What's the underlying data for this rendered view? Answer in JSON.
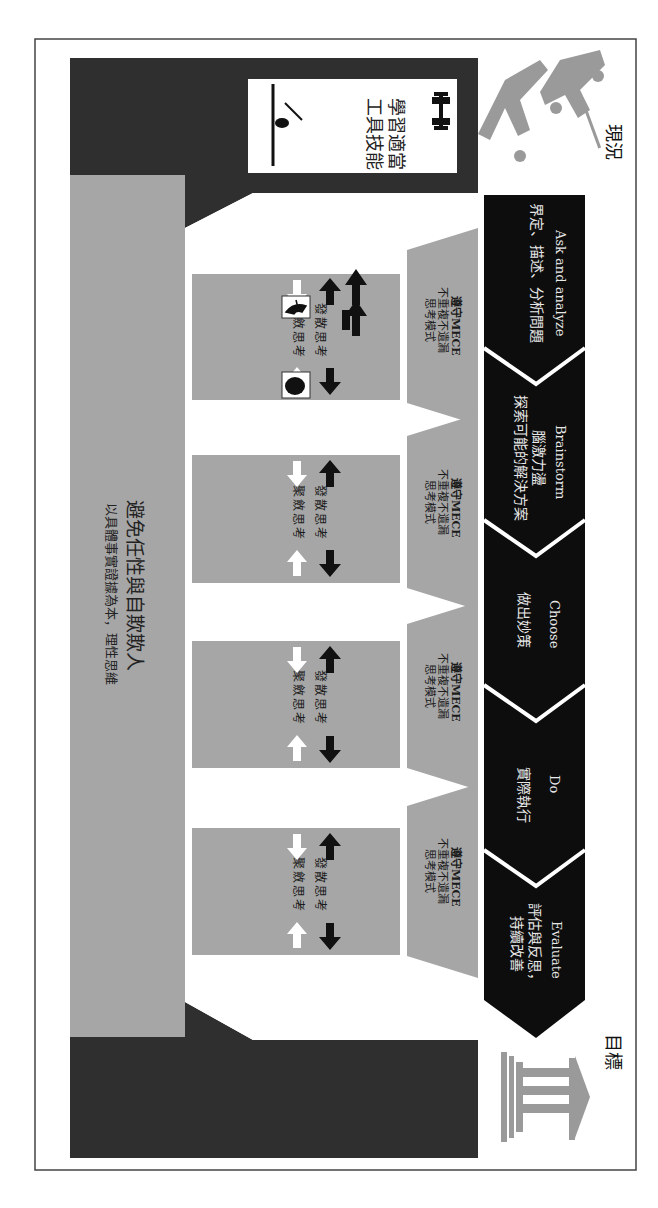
{
  "labels": {
    "current_state": "現況",
    "goal": "目標"
  },
  "foundation": {
    "skills_box": {
      "lines": [
        "學習",
        "適當",
        "工具",
        "技能"
      ]
    },
    "base": {
      "title": "避免任性與自欺欺人",
      "subtitle": "以具體事實證據為本，理性思維"
    }
  },
  "process_steps": [
    {
      "en": "Ask and analyze",
      "zh": "界定、描述、分析問題"
    },
    {
      "en": "Brainstorm",
      "zh": "腦激力盪",
      "zh2": "探索可能的解決方案"
    },
    {
      "en": "Choose",
      "zh": "做出妙策"
    },
    {
      "en": "Do",
      "zh": "實際執行"
    },
    {
      "en": "Evaluate",
      "zh": "評估與反思，",
      "zh2": "持續改善"
    }
  ],
  "pillars": [
    {
      "capital_line1": "遵守MECE",
      "capital_line2": "不重複不遺漏",
      "capital_line3": "思考模式",
      "divergent": "發散思考",
      "convergent": "聚斂思考"
    },
    {
      "capital_line1": "遵守MECE",
      "capital_line2": "不重複不遺漏",
      "capital_line3": "思考模式",
      "divergent": "發散思考",
      "convergent": "聚斂思考"
    },
    {
      "capital_line1": "遵守MECE",
      "capital_line2": "不重複不遺漏",
      "capital_line3": "思考模式",
      "divergent": "發散思考",
      "convergent": "聚斂思考"
    },
    {
      "capital_line1": "遵守MECE",
      "capital_line2": "不重複不遺漏",
      "capital_line3": "思考模式",
      "divergent": "發散思考",
      "convergent": "聚斂思考"
    }
  ],
  "colors": {
    "dark_panel": "#2f2f2f",
    "chevron_band": "#0d0d0d",
    "pillar_gray": "#a6a6a6",
    "icon_gray": "#9a9a9a",
    "border": "#444444"
  }
}
